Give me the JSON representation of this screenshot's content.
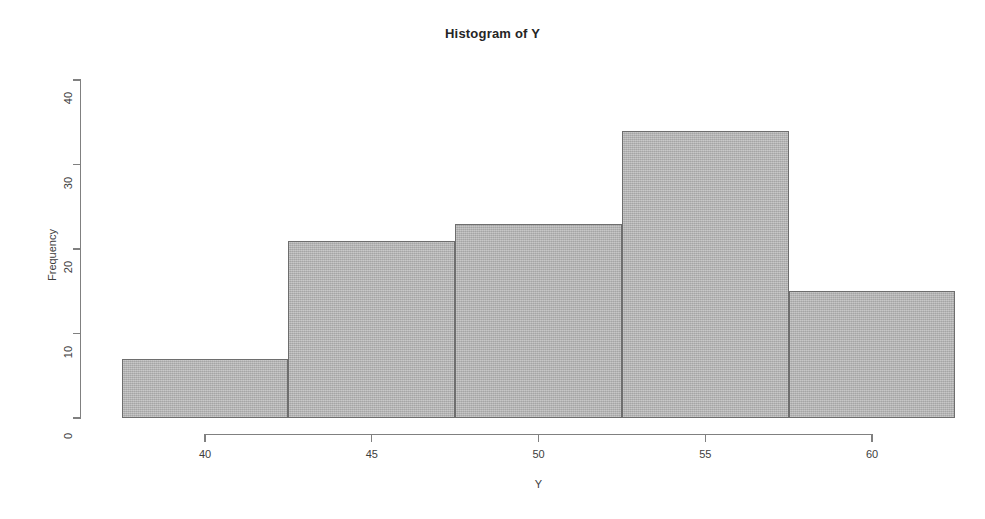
{
  "chart_data": {
    "type": "bar",
    "subtype": "histogram",
    "title": "Histogram of Y",
    "xlabel": "Y",
    "ylabel": "Frequency",
    "bin_edges": [
      37.5,
      42.5,
      47.5,
      52.5,
      57.5,
      62.5
    ],
    "bin_width": 5,
    "categories": [
      "37.5-42.5",
      "42.5-47.5",
      "47.5-52.5",
      "52.5-57.5",
      "57.5-62.5"
    ],
    "values": [
      7,
      21,
      23,
      34,
      15
    ],
    "bars": [
      {
        "bin_start": 37.5,
        "bin_end": 42.5,
        "frequency": 7
      },
      {
        "bin_start": 42.5,
        "bin_end": 47.5,
        "frequency": 21
      },
      {
        "bin_start": 47.5,
        "bin_end": 52.5,
        "frequency": 23
      },
      {
        "bin_start": 52.5,
        "bin_end": 57.5,
        "frequency": 34
      },
      {
        "bin_start": 57.5,
        "bin_end": 62.5,
        "frequency": 15
      }
    ],
    "xlim": [
      37.5,
      62.5
    ],
    "ylim": [
      0,
      40
    ],
    "x_ticks": [
      40,
      45,
      50,
      55,
      60
    ],
    "x_tick_labels": [
      "40",
      "45",
      "50",
      "55",
      "60"
    ],
    "y_ticks": [
      0,
      10,
      20,
      30,
      40
    ],
    "y_tick_labels": [
      "0",
      "10",
      "20",
      "30",
      "40"
    ],
    "grid": false,
    "legend": false,
    "total_count": 100,
    "colors": {
      "bar_fill": "#b5b5b5",
      "bar_border": "#6e6e6e",
      "axis": "#808080",
      "text": "#3d3d3d",
      "title": "#252525",
      "background": "#ffffff"
    }
  },
  "geometry": {
    "x_axis": {
      "pixel_start": 205,
      "pixel_end": 872,
      "value_start": 40,
      "value_end": 60,
      "baseline_y": 434
    },
    "y_axis": {
      "pixel_zero": 418,
      "pixel_top": 80,
      "value_top": 40,
      "axis_x": 80
    },
    "plot_left_pixel": 120,
    "plot_right_pixel": 953
  }
}
